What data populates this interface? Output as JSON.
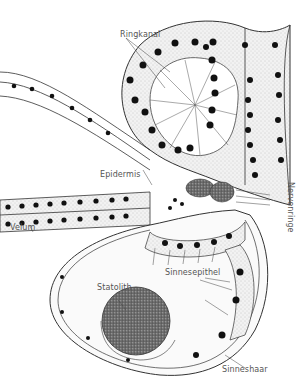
{
  "diagram": {
    "title": "",
    "labels": {
      "ringkanal": "Ringkanal",
      "epidermis": "Epidermis",
      "velum": "Velum",
      "nervenringe": "Nervenringe",
      "sinnesepithel": "Sinnesepithel",
      "statolith": "Statolith",
      "sinneshaar": "Sinneshaar"
    },
    "colors": {
      "line": "#333333",
      "nucleus": "#111111",
      "stipple": "#d8d8d8",
      "statolith_fill": "#5a5a5a",
      "nerve_ring_fill": "#6a6a6a",
      "label_text": "#555555",
      "background": "#ffffff"
    }
  }
}
